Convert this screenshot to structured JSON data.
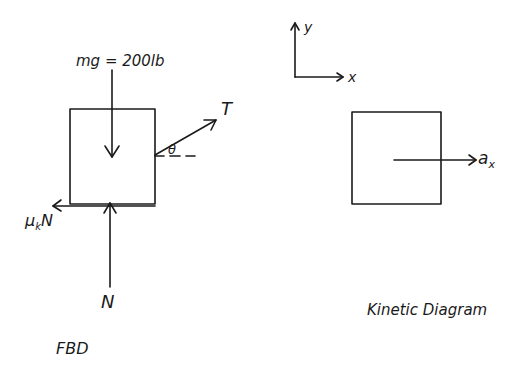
{
  "fbd": {
    "title": "FBD",
    "weight_label": "mg = 200lb",
    "tension_label": "T",
    "angle_label": "θ",
    "friction_label": "μ",
    "friction_sub": "k",
    "friction_N": "N",
    "normal_label": "N"
  },
  "axes": {
    "x_label": "x",
    "y_label": "y"
  },
  "kinetic": {
    "title": "Kinetic Diagram",
    "accel_label": "a",
    "accel_sub": "x"
  },
  "colors": {
    "ink": "#1a1a1a",
    "background": "#ffffff"
  }
}
